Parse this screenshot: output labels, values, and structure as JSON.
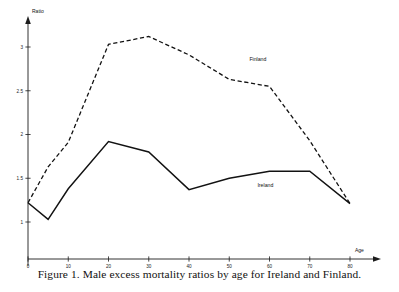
{
  "figure": {
    "caption": "Figure 1.   Male excess mortality ratios by age for Ireland and Finland.",
    "xaxis_title": "Age",
    "yaxis_title": "Ratio"
  },
  "axes": {
    "x_ticks": [
      "0",
      "10",
      "20",
      "30",
      "40",
      "50",
      "60",
      "70",
      "80"
    ],
    "y_ticks": [
      "1",
      "1.5",
      "2",
      "2.5",
      "3"
    ]
  },
  "labels": {
    "finland": "Finland",
    "ireland": "Ireland"
  },
  "chart_data": {
    "type": "line",
    "title": "Male excess mortality ratios by age for Ireland and Finland.",
    "xlabel": "Age",
    "ylabel": "Ratio",
    "xlim": [
      0,
      80
    ],
    "ylim": [
      0.8,
      3.3
    ],
    "xticks": [
      0,
      10,
      20,
      30,
      40,
      50,
      60,
      70,
      80
    ],
    "yticks": [
      1,
      1.5,
      2,
      2.5,
      3
    ],
    "grid": false,
    "legend": "inline-annotations",
    "x": [
      0,
      5,
      10,
      20,
      30,
      40,
      50,
      60,
      70,
      80
    ],
    "series": [
      {
        "name": "Finland",
        "style": "dashed",
        "color": "#121212",
        "values": [
          1.22,
          1.63,
          1.91,
          3.03,
          3.12,
          2.91,
          2.63,
          2.55,
          1.93,
          1.21
        ]
      },
      {
        "name": "Ireland",
        "style": "solid",
        "color": "#121212",
        "values": [
          1.22,
          1.03,
          1.38,
          1.92,
          1.8,
          1.37,
          1.5,
          1.58,
          1.58,
          1.21
        ]
      }
    ]
  }
}
